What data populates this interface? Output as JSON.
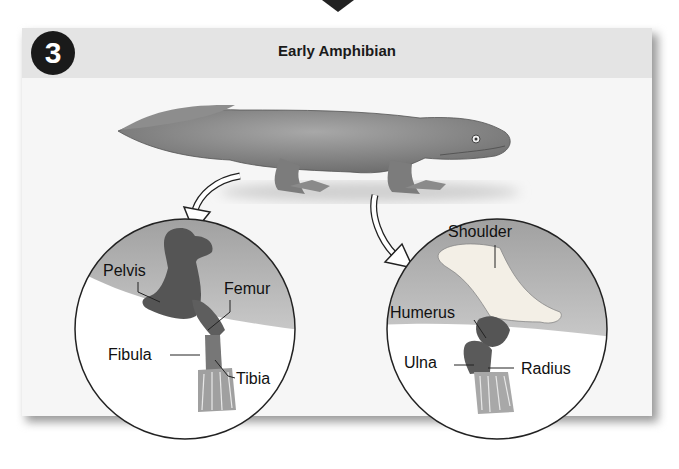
{
  "panel": {
    "step_number": "3",
    "title": "Early Amphibian"
  },
  "hind_limb_inset": {
    "labels": {
      "pelvis": "Pelvis",
      "femur": "Femur",
      "fibula": "Fibula",
      "tibia": "Tibia"
    }
  },
  "fore_limb_inset": {
    "labels": {
      "shoulder": "Shoulder",
      "humerus": "Humerus",
      "ulna": "Ulna",
      "radius": "Radius"
    }
  },
  "colors": {
    "badge": "#1a1a1a",
    "header_band": "#e4e4e4",
    "panel_bg": "#f6f6f6",
    "bone_dark": "#555555",
    "bone_light": "#f3efe6",
    "skin": "#8a8a8a"
  }
}
